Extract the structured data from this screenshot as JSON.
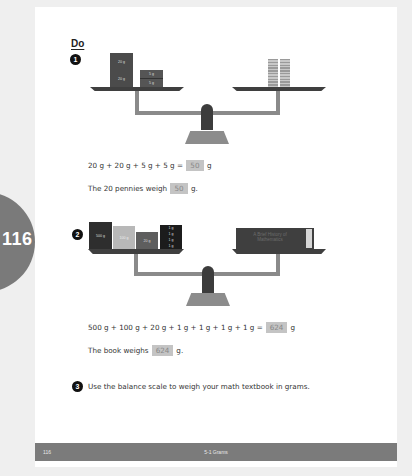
{
  "side_tab": {
    "page_number": "116"
  },
  "heading": "Do",
  "problem1": {
    "number": "1",
    "left_weights": [
      "20 g",
      "20 g",
      "5 g",
      "5 g"
    ],
    "right_item": "20 pennies",
    "equation_prefix": "20 g + 20 g + 5 g + 5 g =",
    "equation_answer": "50",
    "equation_unit": "g",
    "sentence_prefix": "The 20 pennies weigh",
    "sentence_answer": "50",
    "sentence_suffix": "g."
  },
  "problem2": {
    "number": "2",
    "left_weights": [
      "500 g",
      "100 g",
      "20 g",
      "1 g",
      "1 g",
      "1 g",
      "1 g"
    ],
    "right_item": "A Brief History of Mathematics",
    "equation_prefix": "500 g + 100 g + 20 g + 1 g + 1 g + 1 g + 1 g =",
    "equation_answer": "624",
    "equation_unit": "g",
    "sentence_prefix": "The book weighs",
    "sentence_answer": "624",
    "sentence_suffix": "g."
  },
  "problem3": {
    "number": "3",
    "text": "Use the balance scale to weigh your math textbook in grams."
  },
  "footer": {
    "page_number": "116",
    "title": "5-1 Grams"
  },
  "colors": {
    "background": "#efefef",
    "page": "#ffffff",
    "tab": "#7a7a7a",
    "footer": "#7b7b7b",
    "answer_box": "#c4c4c4"
  }
}
